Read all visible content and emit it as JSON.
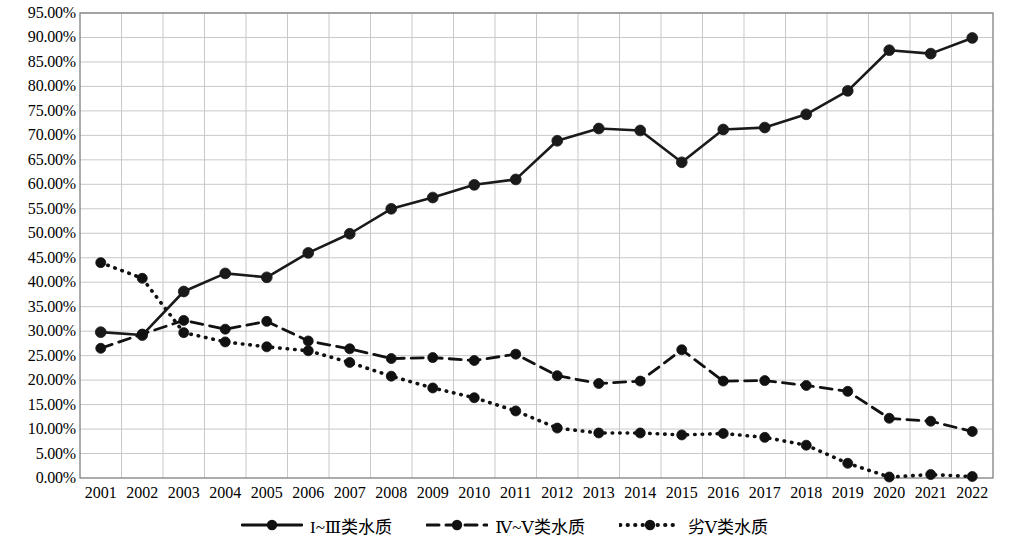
{
  "chart_data": {
    "type": "line",
    "title": "",
    "xlabel": "",
    "ylabel": "",
    "grid": true,
    "legend_position": "bottom",
    "ylim": [
      0,
      95
    ],
    "ytick_labels": [
      "95.00%",
      "90.00%",
      "85.00%",
      "80.00%",
      "75.00%",
      "70.00%",
      "65.00%",
      "60.00%",
      "55.00%",
      "50.00%",
      "45.00%",
      "40.00%",
      "35.00%",
      "30.00%",
      "25.00%",
      "20.00%",
      "15.00%",
      "10.00%",
      "5.00%",
      "0.00%"
    ],
    "ytick_values": [
      95,
      90,
      85,
      80,
      75,
      70,
      65,
      60,
      55,
      50,
      45,
      40,
      35,
      30,
      25,
      20,
      15,
      10,
      5,
      0
    ],
    "categories": [
      "2001",
      "2002",
      "2003",
      "2004",
      "2005",
      "2006",
      "2007",
      "2008",
      "2009",
      "2010",
      "2011",
      "2012",
      "2013",
      "2014",
      "2015",
      "2016",
      "2017",
      "2018",
      "2019",
      "2020",
      "2021",
      "2022"
    ],
    "series": [
      {
        "name": "I~Ⅲ类水质",
        "style": "solid",
        "color": "#1a1a1a",
        "values": [
          29.8,
          29.2,
          38.1,
          41.8,
          41.0,
          46.0,
          49.9,
          55.0,
          57.3,
          59.9,
          61.0,
          68.9,
          71.4,
          71.0,
          64.5,
          71.2,
          71.6,
          74.3,
          79.1,
          87.4,
          86.7,
          89.9
        ]
      },
      {
        "name": "Ⅳ~Ⅴ类水质",
        "style": "dashed",
        "color": "#111111",
        "values": [
          26.5,
          29.4,
          32.2,
          30.4,
          32.0,
          28.0,
          26.4,
          24.4,
          24.6,
          24.0,
          25.3,
          20.9,
          19.3,
          19.8,
          26.2,
          19.8,
          19.9,
          18.9,
          17.7,
          12.2,
          11.6,
          9.5
        ]
      },
      {
        "name": "劣Ⅴ类水质",
        "style": "dotted",
        "color": "#111111",
        "values": [
          44.0,
          40.8,
          29.7,
          27.8,
          26.8,
          26.0,
          23.6,
          20.8,
          18.4,
          16.4,
          13.7,
          10.2,
          9.2,
          9.2,
          8.8,
          9.1,
          8.3,
          6.7,
          3.0,
          0.2,
          0.7,
          0.3
        ]
      }
    ]
  },
  "legend": {
    "items": [
      {
        "label": "I~Ⅲ类水质",
        "style": "solid"
      },
      {
        "label": "Ⅳ~Ⅴ类水质",
        "style": "dashed"
      },
      {
        "label": "劣Ⅴ类水质",
        "style": "dotted"
      }
    ]
  },
  "axes": {
    "plot_left": 80,
    "plot_right": 993,
    "plot_top": 13,
    "plot_bottom": 478,
    "gridline_color": "#c9c9c9",
    "axis_color": "#808080"
  }
}
